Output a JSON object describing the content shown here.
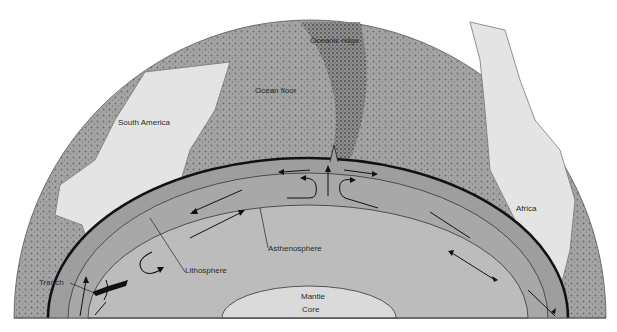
{
  "diagram": {
    "type": "cross-section",
    "labels": {
      "oceanic_ridge": "Oceanic ridge",
      "ocean_floor": "Ocean floor",
      "south_america": "South America",
      "africa": "Africa",
      "trench": "Trench",
      "lithosphere": "Lithosphere",
      "asthenosphere": "Asthenosphere",
      "mantle": "Mantle",
      "core": "Core"
    },
    "colors": {
      "surface_ocean": "#a9a9a9",
      "continent": "#e2e2e2",
      "lithosphere_band": "#9e9e9e",
      "asthenosphere": "#a8a8a8",
      "mantle": "#bcbcbc",
      "core": "#dadada",
      "line": "#1a1a1a"
    }
  }
}
